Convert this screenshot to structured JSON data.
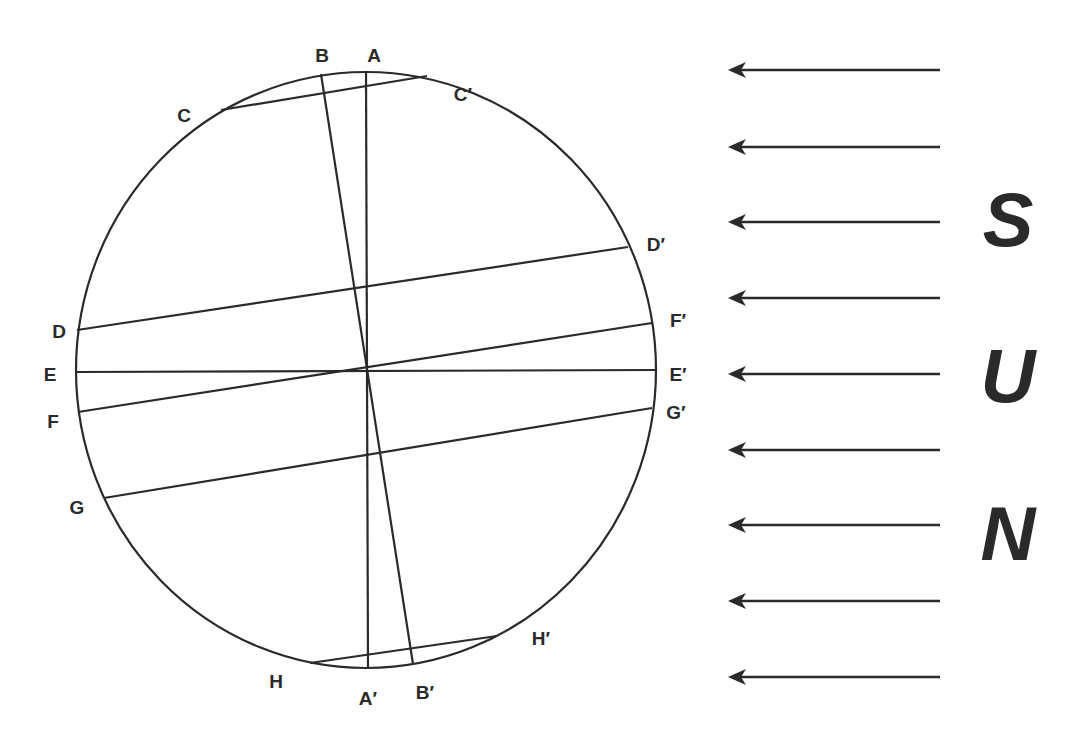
{
  "diagram": {
    "circle": {
      "cx": 366,
      "cy": 370,
      "rx": 290,
      "ry": 298
    },
    "colors": {
      "ink": "#2a2a2a",
      "background": "#ffffff"
    },
    "chords": [
      {
        "from": "A",
        "to": "A′",
        "x1": 366,
        "y1": 71,
        "x2": 368,
        "y2": 668
      },
      {
        "from": "B",
        "to": "B′",
        "x1": 321,
        "y1": 74,
        "x2": 413,
        "y2": 664
      },
      {
        "from": "C",
        "to": "C′",
        "x1": 221,
        "y1": 110,
        "x2": 427,
        "y2": 76
      },
      {
        "from": "D",
        "to": "D′",
        "x1": 77,
        "y1": 330,
        "x2": 628,
        "y2": 247
      },
      {
        "from": "E",
        "to": "E′",
        "x1": 75,
        "y1": 372,
        "x2": 656,
        "y2": 370
      },
      {
        "from": "F",
        "to": "F′",
        "x1": 78,
        "y1": 412,
        "x2": 652,
        "y2": 323
      },
      {
        "from": "G",
        "to": "G′",
        "x1": 104,
        "y1": 498,
        "x2": 652,
        "y2": 408
      },
      {
        "from": "H",
        "to": "H′",
        "x1": 310,
        "y1": 663,
        "x2": 497,
        "y2": 636
      }
    ],
    "labels": [
      {
        "text": "A",
        "x": 374,
        "y": 62
      },
      {
        "text": "B",
        "x": 322,
        "y": 62
      },
      {
        "text": "C",
        "x": 184,
        "y": 122
      },
      {
        "text": "C′",
        "x": 463,
        "y": 101
      },
      {
        "text": "D",
        "x": 59,
        "y": 338
      },
      {
        "text": "D′",
        "x": 656,
        "y": 251
      },
      {
        "text": "E",
        "x": 50,
        "y": 381
      },
      {
        "text": "E′",
        "x": 678,
        "y": 381
      },
      {
        "text": "F",
        "x": 53,
        "y": 428
      },
      {
        "text": "F′",
        "x": 678,
        "y": 327
      },
      {
        "text": "G",
        "x": 77,
        "y": 514
      },
      {
        "text": "G′",
        "x": 676,
        "y": 419
      },
      {
        "text": "H",
        "x": 276,
        "y": 688
      },
      {
        "text": "H′",
        "x": 541,
        "y": 645
      },
      {
        "text": "A′",
        "x": 368,
        "y": 705
      },
      {
        "text": "B′",
        "x": 425,
        "y": 699
      }
    ],
    "sun": {
      "letters": [
        {
          "text": "S",
          "x": 1008,
          "y": 246
        },
        {
          "text": "U",
          "x": 1008,
          "y": 402
        },
        {
          "text": "N",
          "x": 1008,
          "y": 560
        }
      ],
      "arrows": [
        {
          "y": 70
        },
        {
          "y": 147
        },
        {
          "y": 222
        },
        {
          "y": 298
        },
        {
          "y": 374
        },
        {
          "y": 450
        },
        {
          "y": 525
        },
        {
          "y": 601
        },
        {
          "y": 677
        }
      ],
      "arrow_x_start": 940,
      "arrow_x_tip": 728
    }
  }
}
